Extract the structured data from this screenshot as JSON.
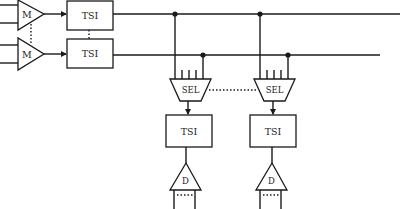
{
  "diagram": {
    "type": "switching-architecture-block-diagram",
    "input_stage": {
      "multiplexers": [
        {
          "label": "M"
        },
        {
          "label": "M"
        }
      ],
      "tsi_blocks": [
        {
          "label": "TSI"
        },
        {
          "label": "TSI"
        }
      ]
    },
    "selector_stage": {
      "selectors": [
        {
          "label": "SEL"
        },
        {
          "label": "SEL"
        }
      ]
    },
    "output_stage": {
      "tsi_blocks": [
        {
          "label": "TSI"
        },
        {
          "label": "TSI"
        }
      ],
      "demultiplexers": [
        {
          "label": "D"
        },
        {
          "label": "D"
        }
      ]
    },
    "colors": {
      "line": "#1a1a1a",
      "background": "#ffffff"
    }
  }
}
